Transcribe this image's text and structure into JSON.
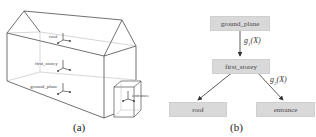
{
  "panel_a": {
    "caption": "(a)",
    "labels": {
      "roof": "roof",
      "first_storey": "first_storey",
      "ground_plane": "ground_plane",
      "entrance": "entrance"
    }
  },
  "panel_b": {
    "caption": "(b)",
    "nodes": {
      "ground_plane": "ground_plane",
      "first_storey": "first_storey",
      "roof": "roof",
      "entrance": "entrance"
    },
    "edges": [
      {
        "from": "ground_plane",
        "to": "first_storey",
        "label_g": "g",
        "label_sub": "1",
        "label_arg": "(X)"
      },
      {
        "from": "first_storey",
        "to": "roof",
        "label_g": "",
        "label_sub": "",
        "label_arg": ""
      },
      {
        "from": "first_storey",
        "to": "entrance",
        "label_g": "g",
        "label_sub": "2",
        "label_arg": "(X)"
      }
    ]
  },
  "colors": {
    "node_fill": "#d9d9d9",
    "line": "#333333"
  }
}
